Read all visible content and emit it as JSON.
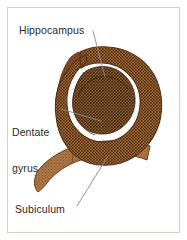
{
  "figure": {
    "type": "anatomical-diagram",
    "frame_color": "#d8cfc2",
    "background_color": "#ffffff",
    "label_text_color": "#2b2b2b",
    "leader_line_color": "#8a8a8a"
  },
  "labels": [
    {
      "id": "hippocampus",
      "text": "Hippocampus"
    },
    {
      "id": "dentate_gyrus_line1",
      "text": "Dentate"
    },
    {
      "id": "dentate_gyrus_line2",
      "text": "gyrus"
    },
    {
      "id": "subiculum",
      "text": "Subiculum"
    }
  ],
  "structures": [
    {
      "id": "hippocampus",
      "name": "Hippocampus",
      "fill_color": "#8a5a2b",
      "texture": "stippled",
      "description": "large comma-shaped stippled mass occupying the upper portion of the section"
    },
    {
      "id": "dentate_gyrus",
      "name": "Dentate gyrus",
      "fill_color": "#7a4a22",
      "texture": "stippled-dark",
      "description": "inner spiral region enclosed within the hippocampal curve"
    },
    {
      "id": "subiculum",
      "name": "Subiculum",
      "fill_color": "#a97342",
      "texture": "fine-grain",
      "description": "lighter tapering band extending to the lower left of the section"
    },
    {
      "id": "outer_rim",
      "name": "Outer rim",
      "fill_color": "#7b4a23",
      "texture": "solid",
      "description": "solid darker brown border along the left and upper margin"
    }
  ],
  "colors": {
    "brown_dark": "#6b3f1d",
    "brown_mid": "#8a5a2b",
    "brown_light": "#a97342",
    "brown_pale": "#bb8b5c",
    "stipple_dot": "#46250c",
    "outline": "#5a3212"
  }
}
